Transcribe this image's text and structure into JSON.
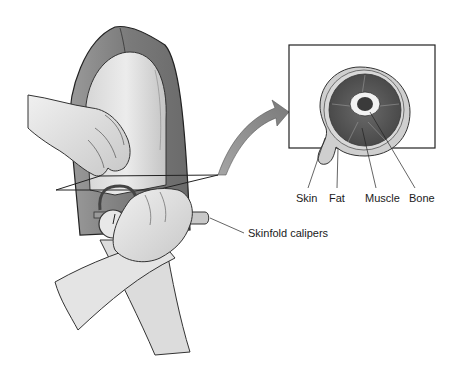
{
  "figure": {
    "type": "medical-illustration",
    "inset": {
      "title": "Cross-section of upper arm",
      "labels": [
        {
          "id": "skin",
          "text": "Skin"
        },
        {
          "id": "fat",
          "text": "Fat"
        },
        {
          "id": "muscle",
          "text": "Muscle"
        },
        {
          "id": "bone",
          "text": "Bone"
        }
      ]
    },
    "callouts": [
      {
        "id": "calipers",
        "text": "Skinfold calipers"
      }
    ],
    "colors": {
      "background": "#ffffff",
      "skin_light": "#e6e6e6",
      "skin_mid": "#bdbdbd",
      "shirt": "#8a8a8a",
      "muscle": "#5a5a5a",
      "fat_layer": "#c8c8c8",
      "arrow": "#8c8c8c",
      "line": "#222222"
    }
  }
}
